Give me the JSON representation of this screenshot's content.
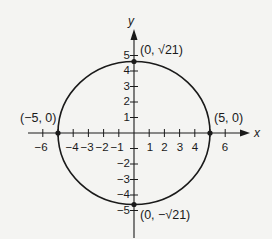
{
  "diagram": {
    "type": "ellipse-graph",
    "equation_description": "Ellipse centered at origin with x-intercepts (±5, 0) and y-intercepts (0, ±√21)",
    "axes": {
      "x_label": "x",
      "y_label": "y",
      "x_ticks": [
        "−6",
        "−4",
        "−3",
        "−2",
        "−1",
        "1",
        "2",
        "3",
        "4",
        "6"
      ],
      "y_ticks": [
        "5",
        "4",
        "3",
        "2",
        "1",
        "−2",
        "−3",
        "−4",
        "−5"
      ]
    },
    "points": [
      {
        "label": "(0, √21)",
        "x": 0,
        "y": 4.583
      },
      {
        "label": "(−5, 0)",
        "x": -5,
        "y": 0
      },
      {
        "label": "(5, 0)",
        "x": 5,
        "y": 0
      },
      {
        "label": "(0, −√21)",
        "x": 0,
        "y": -4.583
      }
    ],
    "colors": {
      "stroke": "#1a1a1a",
      "background": "#f4f4f2"
    }
  }
}
